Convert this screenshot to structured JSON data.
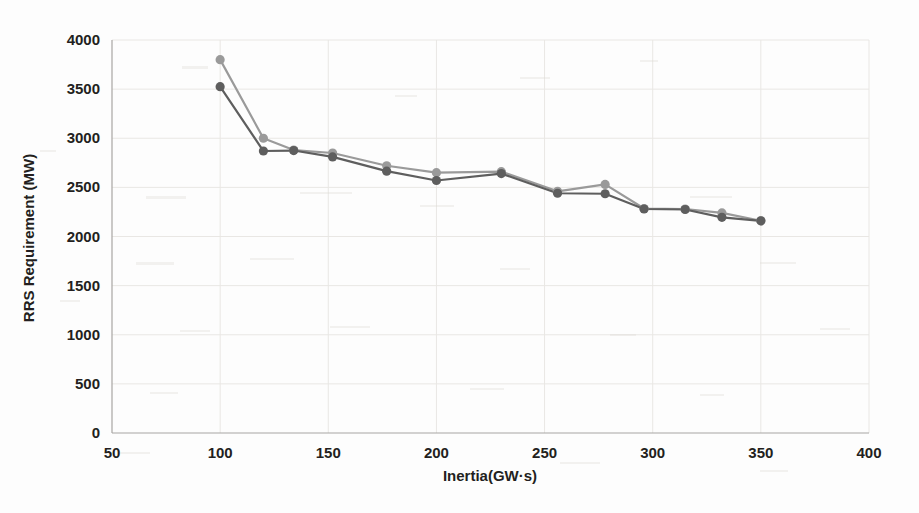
{
  "chart_data": {
    "type": "line",
    "title": "",
    "xlabel": "Inertia(GW·s)",
    "ylabel": "RRS Requirement (MW)",
    "xlim": [
      50,
      400
    ],
    "ylim": [
      0,
      4000
    ],
    "xticks": [
      50,
      100,
      150,
      200,
      250,
      300,
      350,
      400
    ],
    "yticks": [
      0,
      500,
      1000,
      1500,
      2000,
      2500,
      3000,
      3500,
      4000
    ],
    "xtick_labels": [
      "50",
      "100",
      "150",
      "200",
      "250",
      "300",
      "350",
      "400"
    ],
    "ytick_labels": [
      "0",
      "500",
      "1000",
      "1500",
      "2000",
      "2500",
      "3000",
      "3500",
      "4000"
    ],
    "grid": true,
    "grid_axis": "both",
    "legend": false,
    "legend_position": "none",
    "x": [
      100,
      120,
      134,
      152,
      177,
      200,
      230,
      256,
      278,
      296,
      315,
      332,
      350
    ],
    "series": [
      {
        "name": "series-upper",
        "color": "#9a9a9a",
        "marker": "circle",
        "values": [
          3800,
          3000,
          2880,
          2850,
          2720,
          2650,
          2660,
          2460,
          2530,
          2285,
          2280,
          2240,
          2160
        ]
      },
      {
        "name": "series-lower",
        "color": "#5e5e5e",
        "marker": "circle",
        "values": [
          3525,
          2870,
          2875,
          2810,
          2665,
          2570,
          2640,
          2440,
          2435,
          2280,
          2275,
          2195,
          2160
        ]
      }
    ]
  },
  "colors": {
    "upper_series": "#9a9a9a",
    "lower_series": "#5e5e5e",
    "grid": "#e9e7e4",
    "axis": "#a8a6a3",
    "text": "#231f20",
    "background": "#fdfdfd"
  },
  "axes": {
    "x_title": "Inertia(GW·s)",
    "y_title": "RRS Requirement (MW)"
  }
}
